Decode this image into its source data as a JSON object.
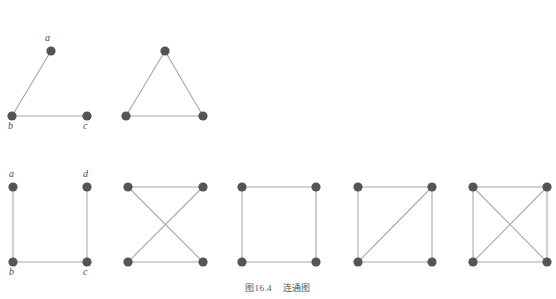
{
  "figure": {
    "caption": "图16.4    连通图",
    "caption_number": "图16.4",
    "caption_title": "连通图",
    "colors": {
      "vertex": "#555558",
      "edge": "#a8a8ab",
      "label": "#4a4a4a",
      "caption": "#57575a",
      "background": "#ffffff"
    },
    "vertex_radius": 4.6,
    "edge_width": 1.1
  },
  "graphs": [
    {
      "id": "graph-1-path-abc",
      "name": "path-graph-a-b-c",
      "vertices": [
        {
          "id": "a",
          "label": "a",
          "x": 51,
          "y": 51,
          "label_x": 45,
          "label_y": 33,
          "labeled": true
        },
        {
          "id": "b",
          "label": "b",
          "x": 12,
          "y": 116,
          "label_x": 8,
          "label_y": 121,
          "labeled": true
        },
        {
          "id": "c",
          "label": "c",
          "x": 87,
          "y": 116,
          "label_x": 83,
          "label_y": 121,
          "labeled": true
        }
      ],
      "edges": [
        {
          "from": "a",
          "to": "b"
        },
        {
          "from": "b",
          "to": "c"
        }
      ]
    },
    {
      "id": "graph-2-triangle",
      "name": "triangle-graph",
      "vertices": [
        {
          "id": "t",
          "label": "",
          "x": 165,
          "y": 51,
          "labeled": false
        },
        {
          "id": "bl",
          "label": "",
          "x": 126,
          "y": 116,
          "labeled": false
        },
        {
          "id": "br",
          "label": "",
          "x": 203,
          "y": 116,
          "labeled": false
        }
      ],
      "edges": [
        {
          "from": "t",
          "to": "bl"
        },
        {
          "from": "t",
          "to": "br"
        },
        {
          "from": "bl",
          "to": "br"
        }
      ]
    },
    {
      "id": "graph-3-path-abcd",
      "name": "u-shaped-path-graph-a-b-c-d",
      "vertices": [
        {
          "id": "a",
          "label": "a",
          "x": 13,
          "y": 187,
          "label_x": 9,
          "label_y": 169,
          "labeled": true
        },
        {
          "id": "d",
          "label": "d",
          "x": 87,
          "y": 187,
          "label_x": 83,
          "label_y": 169,
          "labeled": true
        },
        {
          "id": "b",
          "label": "b",
          "x": 13,
          "y": 262,
          "label_x": 9,
          "label_y": 267,
          "labeled": true
        },
        {
          "id": "c",
          "label": "c",
          "x": 87,
          "y": 262,
          "label_x": 83,
          "label_y": 267,
          "labeled": true
        }
      ],
      "edges": [
        {
          "from": "a",
          "to": "b"
        },
        {
          "from": "b",
          "to": "c"
        },
        {
          "from": "c",
          "to": "d"
        }
      ]
    },
    {
      "id": "graph-4-bowtie",
      "name": "four-cycle-with-crossed-diagonals-no-sides",
      "vertices": [
        {
          "id": "tl",
          "label": "",
          "x": 128,
          "y": 187,
          "labeled": false
        },
        {
          "id": "tr",
          "label": "",
          "x": 203,
          "y": 187,
          "labeled": false
        },
        {
          "id": "bl",
          "label": "",
          "x": 128,
          "y": 262,
          "labeled": false
        },
        {
          "id": "br",
          "label": "",
          "x": 203,
          "y": 262,
          "labeled": false
        }
      ],
      "edges": [
        {
          "from": "tl",
          "to": "tr"
        },
        {
          "from": "bl",
          "to": "br"
        },
        {
          "from": "tl",
          "to": "br"
        },
        {
          "from": "tr",
          "to": "bl"
        }
      ]
    },
    {
      "id": "graph-5-square",
      "name": "square-four-cycle-graph",
      "vertices": [
        {
          "id": "tl",
          "label": "",
          "x": 242,
          "y": 187,
          "labeled": false
        },
        {
          "id": "tr",
          "label": "",
          "x": 316,
          "y": 187,
          "labeled": false
        },
        {
          "id": "bl",
          "label": "",
          "x": 242,
          "y": 262,
          "labeled": false
        },
        {
          "id": "br",
          "label": "",
          "x": 316,
          "y": 262,
          "labeled": false
        }
      ],
      "edges": [
        {
          "from": "tl",
          "to": "tr"
        },
        {
          "from": "tr",
          "to": "br"
        },
        {
          "from": "br",
          "to": "bl"
        },
        {
          "from": "bl",
          "to": "tl"
        }
      ]
    },
    {
      "id": "graph-6-square-one-diagonal",
      "name": "square-with-one-diagonal-graph",
      "vertices": [
        {
          "id": "tl",
          "label": "",
          "x": 358,
          "y": 187,
          "labeled": false
        },
        {
          "id": "tr",
          "label": "",
          "x": 432,
          "y": 187,
          "labeled": false
        },
        {
          "id": "bl",
          "label": "",
          "x": 358,
          "y": 262,
          "labeled": false
        },
        {
          "id": "br",
          "label": "",
          "x": 432,
          "y": 262,
          "labeled": false
        }
      ],
      "edges": [
        {
          "from": "tl",
          "to": "tr"
        },
        {
          "from": "tr",
          "to": "br"
        },
        {
          "from": "br",
          "to": "bl"
        },
        {
          "from": "bl",
          "to": "tl"
        },
        {
          "from": "bl",
          "to": "tr"
        }
      ]
    },
    {
      "id": "graph-7-complete-k4",
      "name": "complete-graph-k4",
      "vertices": [
        {
          "id": "tl",
          "label": "",
          "x": 473,
          "y": 187,
          "labeled": false
        },
        {
          "id": "tr",
          "label": "",
          "x": 547,
          "y": 187,
          "labeled": false
        },
        {
          "id": "bl",
          "label": "",
          "x": 473,
          "y": 262,
          "labeled": false
        },
        {
          "id": "br",
          "label": "",
          "x": 547,
          "y": 262,
          "labeled": false
        }
      ],
      "edges": [
        {
          "from": "tl",
          "to": "tr"
        },
        {
          "from": "tr",
          "to": "br"
        },
        {
          "from": "br",
          "to": "bl"
        },
        {
          "from": "bl",
          "to": "tl"
        },
        {
          "from": "tl",
          "to": "br"
        },
        {
          "from": "tr",
          "to": "bl"
        }
      ]
    }
  ]
}
